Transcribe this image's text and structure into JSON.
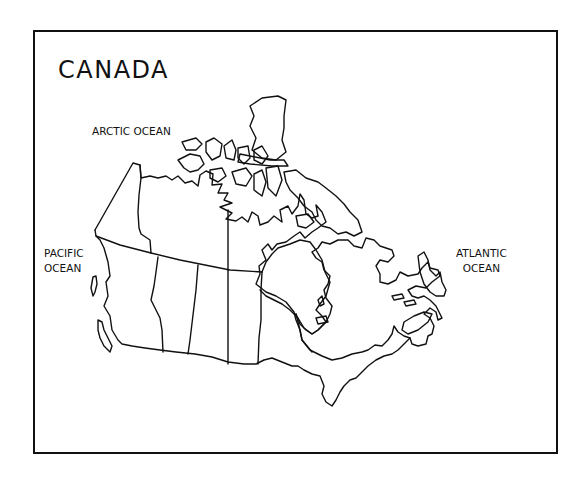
{
  "map": {
    "title": "CANADA",
    "labels": {
      "arctic": "ARCTIC OCEAN",
      "pacific_line1": "PACIFIC",
      "pacific_line2": "OCEAN",
      "atlantic_line1": "ATLANTIC",
      "atlantic_line2": "OCEAN"
    },
    "style": {
      "stroke_color": "#111111",
      "background": "#ffffff"
    }
  }
}
